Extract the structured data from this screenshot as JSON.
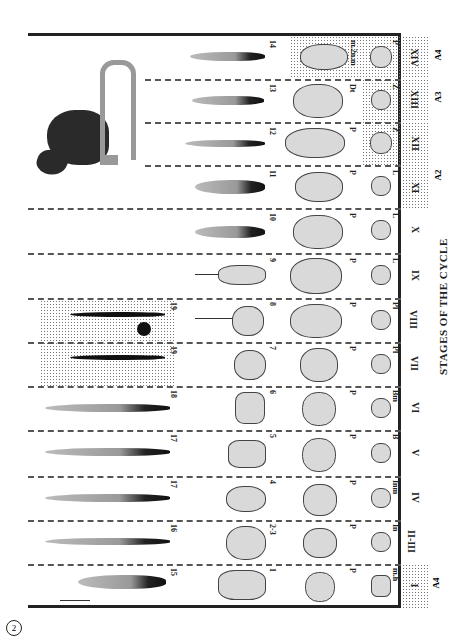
{
  "figure": {
    "number": "2",
    "axis_title": "STAGES OF THE CYCLE",
    "host_image": "mouse-illustration",
    "stages": [
      {
        "label": "I",
        "group": "A4",
        "numbers": [
          "15"
        ],
        "cell_number": "1",
        "col3_label": "P",
        "col4_label": "m.h"
      },
      {
        "label": "II-III",
        "numbers": [
          "16"
        ],
        "cell_number": "2-3",
        "col3_label": "P",
        "col4_label": "In"
      },
      {
        "label": "IV",
        "numbers": [
          "17"
        ],
        "cell_number": "4",
        "col3_label": "P",
        "col4_label": "Inm"
      },
      {
        "label": "V",
        "numbers": [
          "17"
        ],
        "cell_number": "5",
        "col3_label": "P",
        "col4_label": "B"
      },
      {
        "label": "VI",
        "numbers": [
          "18"
        ],
        "cell_number": "6",
        "col3_label": "P",
        "col4_label": "Bm"
      },
      {
        "label": "VII",
        "numbers": [
          "19"
        ],
        "cell_number": "7",
        "col3_label": "P",
        "col4_label": "Pl"
      },
      {
        "label": "VIII",
        "numbers": [
          "19"
        ],
        "cell_number": "8",
        "col3_label": "P",
        "col4_label": "Pl"
      },
      {
        "label": "IX",
        "numbers": [],
        "cell_number": "9",
        "col3_label": "P",
        "col4_label": "L"
      },
      {
        "label": "X",
        "numbers": [],
        "cell_number": "10",
        "col3_label": "P",
        "col4_label": "L"
      },
      {
        "label": "XI",
        "group": "A2",
        "numbers": [],
        "cell_number": "11",
        "col3_label": "P",
        "col4_label": "L"
      },
      {
        "label": "XII",
        "group": "A2",
        "numbers": [],
        "cell_number": "12",
        "col3_label": "P",
        "col4_label": "Z"
      },
      {
        "label": "XIII",
        "group": "A3",
        "numbers": [],
        "cell_number": "13",
        "col3_label": "Dt",
        "col4_label": "Z"
      },
      {
        "label": "XIV",
        "group": "A4",
        "numbers": [],
        "cell_number": "14",
        "col3_label": "m.2n.m",
        "col4_label": "P"
      }
    ],
    "group_labels": [
      {
        "label": "A4",
        "position": "bottom"
      },
      {
        "label": "A2",
        "position": "top"
      },
      {
        "label": "A3",
        "position": "top"
      },
      {
        "label": "A4",
        "position": "top"
      }
    ]
  }
}
